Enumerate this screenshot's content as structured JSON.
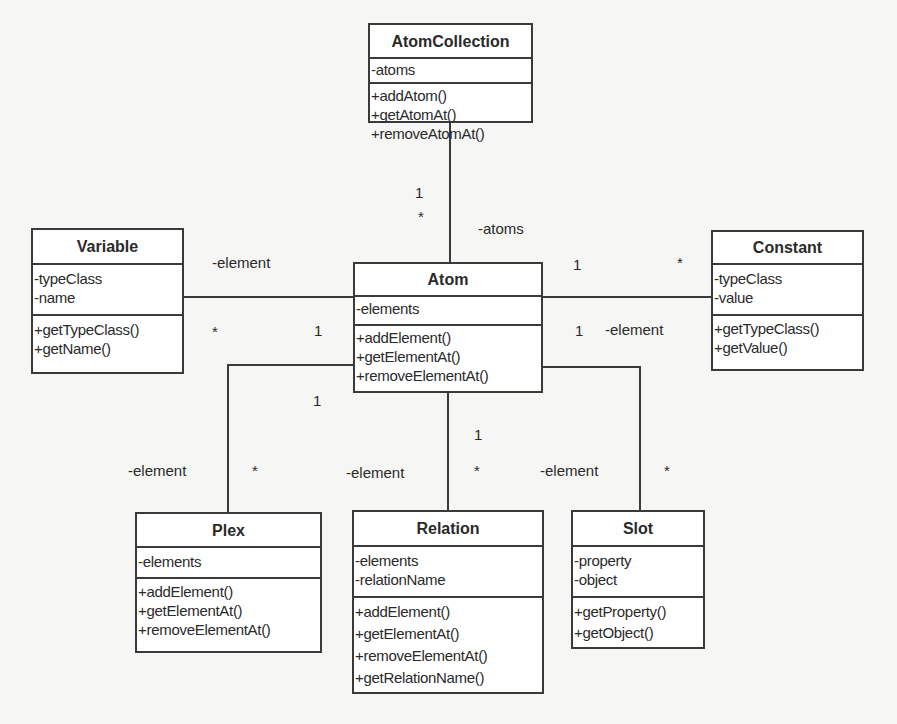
{
  "diagram": {
    "type": "uml-class-diagram",
    "classes": {
      "atom_collection": {
        "name": "AtomCollection",
        "attributes": [
          "-atoms"
        ],
        "operations": [
          "+addAtom()",
          "+getAtomAt()",
          "+removeAtomAt()"
        ]
      },
      "atom": {
        "name": "Atom",
        "attributes": [
          "-elements"
        ],
        "operations": [
          "+addElement()",
          "+getElementAt()",
          "+removeElementAt()"
        ]
      },
      "variable": {
        "name": "Variable",
        "attributes": [
          "-typeClass",
          "-name"
        ],
        "operations": [
          "+getTypeClass()",
          "+getName()"
        ]
      },
      "constant": {
        "name": "Constant",
        "attributes": [
          "-typeClass",
          "-value"
        ],
        "operations": [
          "+getTypeClass()",
          "+getValue()"
        ]
      },
      "plex": {
        "name": "Plex",
        "attributes": [
          "-elements"
        ],
        "operations": [
          "+addElement()",
          "+getElementAt()",
          "+removeElementAt()"
        ]
      },
      "relation": {
        "name": "Relation",
        "attributes": [
          "-elements",
          "-relationName"
        ],
        "operations": [
          "+addElement()",
          "+getElementAt()",
          "+removeElementAt()",
          "+getRelationName()"
        ]
      },
      "slot": {
        "name": "Slot",
        "attributes": [
          "-property",
          "-object"
        ],
        "operations": [
          "+getProperty()",
          "+getObject()"
        ]
      }
    },
    "associations": [
      {
        "from": "AtomCollection",
        "to": "Atom",
        "from_mult": "1",
        "to_mult": "*",
        "role": "-atoms"
      },
      {
        "from": "Atom",
        "to": "Variable",
        "from_mult": "1",
        "to_mult": "*",
        "role": "-element"
      },
      {
        "from": "Atom",
        "to": "Constant",
        "from_mult": "1",
        "to_mult": "*",
        "role": "-element"
      },
      {
        "from": "Atom",
        "to": "Plex",
        "from_mult": "1",
        "to_mult": "*",
        "role": "-element"
      },
      {
        "from": "Atom",
        "to": "Relation",
        "from_mult": "1",
        "to_mult": "*",
        "role": "-element"
      },
      {
        "from": "Atom",
        "to": "Slot",
        "from_mult": "1",
        "to_mult": "*",
        "role": "-element"
      }
    ],
    "labels": {
      "atoms_role": "-atoms",
      "atoms_mult_one": "1",
      "atoms_mult_many": "*",
      "variable_role": "-element",
      "variable_mult_many": "*",
      "variable_mult_one": "1",
      "constant_mult_one_top": "1",
      "constant_mult_many": "*",
      "constant_mult_one": "1",
      "constant_role": "-element",
      "plex_mult_one": "1",
      "plex_role": "-element",
      "plex_mult_many": "*",
      "relation_mult_one": "1",
      "relation_mult_many": "*",
      "relation_role": "-element",
      "slot_role": "-element",
      "slot_mult_many": "*"
    }
  }
}
